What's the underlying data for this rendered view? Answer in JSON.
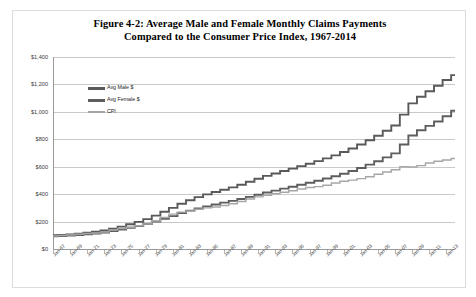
{
  "figure": {
    "title_line1": "Figure 4-2: Average Male and Female Monthly Claims Payments",
    "title_line2": "Compared to the Consumer Price Index, 1967-2014"
  },
  "colors": {
    "male": "#595959",
    "female": "#5e5e5e",
    "cpi": "#a6a6a6",
    "gridline": "#c9c9c9",
    "axis": "#9a9a9a",
    "border": "#dcdcdc",
    "text": "#3a3a3a"
  },
  "chart_data": {
    "type": "line",
    "title": "Figure 4-2: Average Male and Female Monthly Claims Payments Compared to the Consumer Price Index, 1967-2014",
    "xlabel": "",
    "ylabel": "",
    "ylim": [
      0,
      1400
    ],
    "yticks": [
      0,
      200,
      400,
      600,
      800,
      1000,
      1200,
      1400
    ],
    "ytick_labels": [
      "$0",
      "$200",
      "$400",
      "$600",
      "$800",
      "$1,000",
      "$1,200",
      "$1,400"
    ],
    "grid": true,
    "legend_position": "top-left",
    "xtick_labels": [
      "Jan-67",
      "Jan-69",
      "Jan-71",
      "Jan-73",
      "Jan-75",
      "Jan-77",
      "Jan-79",
      "Jan-81",
      "Jan-83",
      "Jan-85",
      "Jan-87",
      "Jan-89",
      "Jan-91",
      "Jan-93",
      "Jan-95",
      "Jan-97",
      "Jan-99",
      "Jan-01",
      "Jan-03",
      "Jan-05",
      "Jan-07",
      "Jan-09",
      "Jan-11",
      "Jan-13"
    ],
    "x": [
      1967,
      1968,
      1969,
      1970,
      1971,
      1972,
      1973,
      1974,
      1975,
      1976,
      1977,
      1978,
      1979,
      1980,
      1981,
      1982,
      1983,
      1984,
      1985,
      1986,
      1987,
      1988,
      1989,
      1990,
      1991,
      1992,
      1993,
      1994,
      1995,
      1996,
      1997,
      1998,
      1999,
      2000,
      2001,
      2002,
      2003,
      2004,
      2005,
      2006,
      2007,
      2008,
      2009,
      2010,
      2011,
      2012,
      2013,
      2014
    ],
    "series": [
      {
        "name": "Avg Male $",
        "color": "#595959",
        "values": [
          100,
          103,
          107,
          112,
          118,
          126,
          135,
          148,
          163,
          180,
          198,
          218,
          243,
          272,
          300,
          330,
          356,
          378,
          398,
          416,
          432,
          449,
          468,
          490,
          512,
          533,
          551,
          569,
          586,
          604,
          622,
          641,
          661,
          683,
          707,
          733,
          762,
          793,
          826,
          862,
          900,
          980,
          1062,
          1110,
          1150,
          1190,
          1232,
          1268
        ]
      },
      {
        "name": "Avg Female $",
        "color": "#5e5e5e",
        "values": [
          92,
          95,
          98,
          102,
          107,
          113,
          120,
          130,
          142,
          155,
          168,
          182,
          200,
          220,
          240,
          262,
          280,
          296,
          311,
          325,
          338,
          351,
          365,
          380,
          396,
          412,
          426,
          440,
          454,
          468,
          483,
          498,
          514,
          531,
          549,
          569,
          591,
          615,
          640,
          668,
          697,
          762,
          828,
          866,
          898,
          930,
          968,
          1008
        ]
      },
      {
        "name": "CPI",
        "color": "#a6a6a6",
        "values": [
          95,
          98,
          102,
          108,
          113,
          117,
          124,
          138,
          150,
          159,
          169,
          182,
          203,
          230,
          254,
          269,
          278,
          290,
          300,
          306,
          317,
          330,
          346,
          365,
          380,
          392,
          403,
          414,
          425,
          438,
          448,
          455,
          465,
          481,
          494,
          502,
          513,
          527,
          545,
          562,
          578,
          600,
          598,
          608,
          627,
          640,
          649,
          660
        ]
      }
    ]
  },
  "legend": {
    "items": [
      {
        "label": "Avg Male $",
        "color": "#595959"
      },
      {
        "label": "Avg Female $",
        "color": "#5e5e5e"
      },
      {
        "label": "CPI",
        "color": "#a6a6a6"
      }
    ]
  }
}
